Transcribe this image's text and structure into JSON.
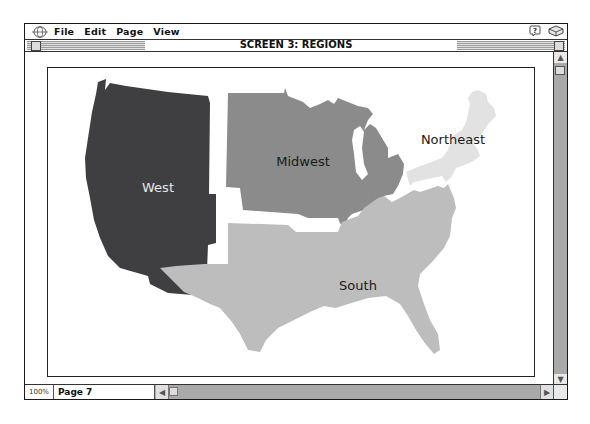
{
  "menubar": {
    "items": [
      "File",
      "Edit",
      "Page",
      "View"
    ],
    "icons": [
      "globe-icon",
      "help-balloon-icon",
      "notebook-icon"
    ]
  },
  "window": {
    "title": "SCREEN 3: REGIONS"
  },
  "map": {
    "regions": [
      {
        "name": "West",
        "label": "West",
        "color": "#3f3f42",
        "label_color": "#e8e8e8"
      },
      {
        "name": "Midwest",
        "label": "Midwest",
        "color": "#8b8b8b",
        "label_color": "#1a1a1a"
      },
      {
        "name": "Northeast",
        "label": "Northeast",
        "color": "#e2e2e2",
        "label_color": "#1a1a1a"
      },
      {
        "name": "South",
        "label": "South",
        "color": "#bdbdbd",
        "label_color": "#1a1a1a"
      }
    ]
  },
  "statusbar": {
    "zoom_level": "100%",
    "page_label": "Page 7"
  },
  "colors": {
    "scrollbar": "#a9a9a9",
    "frame": "#222222"
  }
}
